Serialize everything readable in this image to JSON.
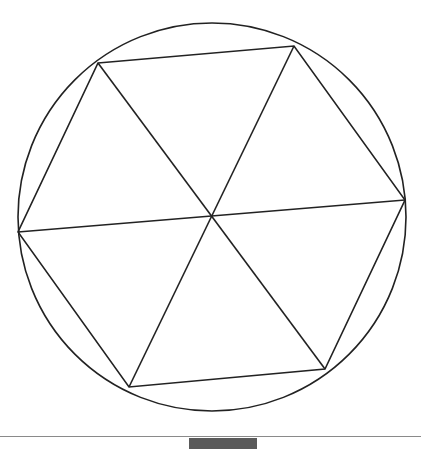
{
  "figure": {
    "circle": {
      "cx": 212,
      "cy": 217,
      "r": 194
    },
    "center": {
      "x": 212,
      "y": 216
    },
    "vertices": [
      {
        "x": 98,
        "y": 63
      },
      {
        "x": 294,
        "y": 46
      },
      {
        "x": 405,
        "y": 200
      },
      {
        "x": 325,
        "y": 369
      },
      {
        "x": 129,
        "y": 387
      },
      {
        "x": 18,
        "y": 232
      }
    ],
    "stroke_color": "#222222",
    "stroke_width": 1.6
  },
  "footer": {
    "rule_color": "#8a8a8a",
    "tab_color": "#5a5a5a"
  }
}
